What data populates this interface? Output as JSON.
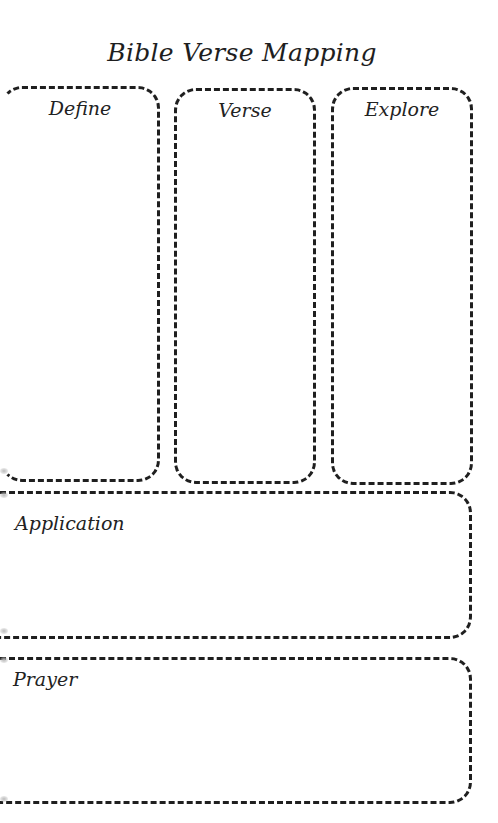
{
  "title": "Bible Verse Mapping",
  "columns": [
    {
      "label": "Define"
    },
    {
      "label": "Verse"
    },
    {
      "label": "Explore"
    }
  ],
  "sections": [
    {
      "label": "Application"
    },
    {
      "label": "Prayer"
    }
  ],
  "colors": {
    "border": "#1f1f1f",
    "background": "#ffffff",
    "text": "#222222"
  }
}
